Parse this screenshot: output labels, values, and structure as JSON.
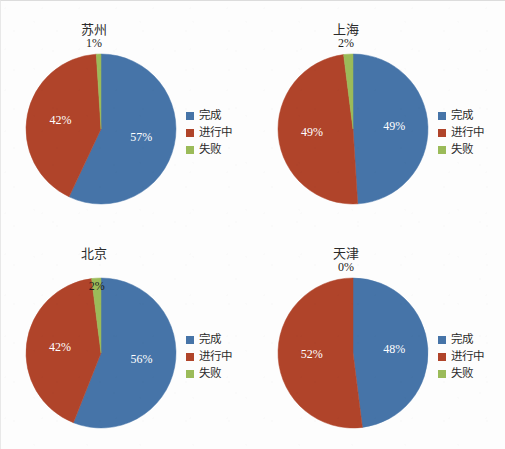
{
  "colors": {
    "complete": "#4674A8",
    "in_progress": "#B0442A",
    "failed": "#9BBB59",
    "background": "#fdfdfd",
    "text": "#2b2b2b"
  },
  "legend": {
    "items": [
      {
        "label": "完成",
        "color": "#4674A8"
      },
      {
        "label": "进行中",
        "color": "#B0442A"
      },
      {
        "label": "失败",
        "color": "#9BBB59"
      }
    ]
  },
  "chart_data": [
    {
      "type": "pie",
      "title": "苏州",
      "categories": [
        "完成",
        "进行中",
        "失败"
      ],
      "values": [
        57,
        42,
        1
      ],
      "labels": [
        "57%",
        "42%",
        "1%"
      ],
      "colors": [
        "#4674A8",
        "#B0442A",
        "#9BBB59"
      ],
      "top_label": "1%",
      "start_angle": 0,
      "legend_position": "right"
    },
    {
      "type": "pie",
      "title": "上海",
      "categories": [
        "完成",
        "进行中",
        "失败"
      ],
      "values": [
        49,
        49,
        2
      ],
      "labels": [
        "49%",
        "49%",
        "2%"
      ],
      "colors": [
        "#4674A8",
        "#B0442A",
        "#9BBB59"
      ],
      "top_label": "2%",
      "start_angle": 0,
      "legend_position": "right"
    },
    {
      "type": "pie",
      "title": "北京",
      "categories": [
        "完成",
        "进行中",
        "失败"
      ],
      "values": [
        56,
        42,
        2
      ],
      "labels": [
        "56%",
        "42%",
        "2%"
      ],
      "colors": [
        "#4674A8",
        "#B0442A",
        "#9BBB59"
      ],
      "inside_label": "2%",
      "start_angle": 0,
      "legend_position": "right"
    },
    {
      "type": "pie",
      "title": "天津",
      "categories": [
        "完成",
        "进行中",
        "失败"
      ],
      "values": [
        48,
        52,
        0
      ],
      "labels": [
        "48%",
        "52%",
        "0%"
      ],
      "colors": [
        "#4674A8",
        "#B0442A",
        "#9BBB59"
      ],
      "top_label": "0%",
      "start_angle": 0,
      "legend_position": "right"
    }
  ]
}
